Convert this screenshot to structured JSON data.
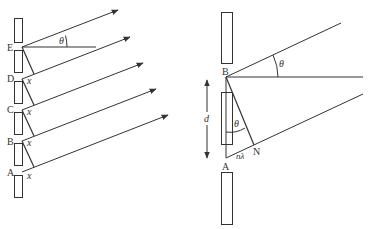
{
  "left_diagram": {
    "description": "Diffraction grating: multiple slits A–E with parallel rays at angle theta",
    "slit_labels": [
      "E",
      "D",
      "C",
      "B",
      "A"
    ],
    "angle_label": "θ",
    "path_difference_label": "x",
    "x_labels": [
      "x",
      "x",
      "x",
      "x"
    ]
  },
  "right_diagram": {
    "description": "Two adjacent slits A and B separated by d, path difference nλ",
    "point_top": "B",
    "point_bottom": "A",
    "point_foot": "N",
    "angle_label_top": "θ",
    "angle_label_inner": "θ",
    "separation_label": "d",
    "path_difference_label": "nλ"
  },
  "colors": {
    "line": "#333333",
    "background": "#ffffff"
  }
}
